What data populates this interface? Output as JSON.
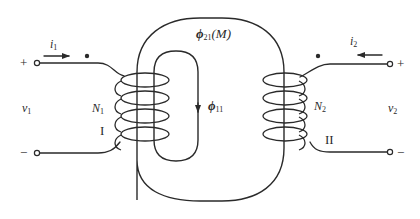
{
  "diagram": {
    "type": "coupled-coils-transformer",
    "stroke_color": "#2a2a2a",
    "background": "#ffffff",
    "primary": {
      "current_label": "i",
      "current_sub": "1",
      "current_direction": "right",
      "plus_label": "+",
      "minus_label": "−",
      "voltage_label": "v",
      "voltage_sub": "1",
      "turns_label": "N",
      "turns_sub": "1",
      "coil_id": "I",
      "dot_mark": "•"
    },
    "secondary": {
      "current_label": "i",
      "current_sub": "2",
      "current_direction": "left",
      "plus_label": "+",
      "minus_label": "−",
      "voltage_label": "v",
      "voltage_sub": "2",
      "turns_label": "N",
      "turns_sub": "2",
      "coil_id": "II",
      "dot_mark": "•"
    },
    "flux": {
      "mutual_label": "ϕ",
      "mutual_sub": "21",
      "mutual_suffix": "(M)",
      "leakage_label": "ϕ",
      "leakage_sub": "11"
    }
  }
}
